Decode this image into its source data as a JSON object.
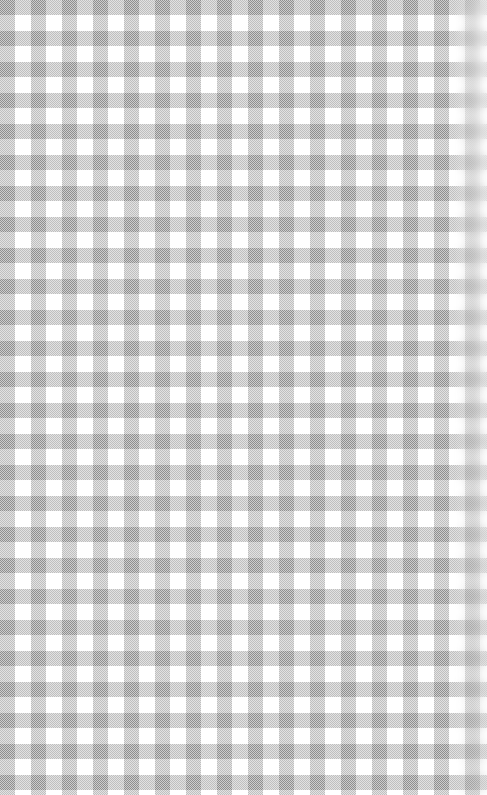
{
  "image": {
    "kind": "seamless-gingham-check-texture",
    "title": "Gray gingham check fabric texture",
    "width_px": 487,
    "height_px": 795
  },
  "pattern": {
    "name": "gingham",
    "alt_names": "buffalo check, vichy check, picnic tablecloth check",
    "cell_size_px": 31,
    "half_cell_px": 15.5,
    "origin_phase": "dark-square-at-top-left",
    "stripe_axes": "two orthogonal stripe sets (horizontal and vertical)",
    "tone_levels": 3,
    "weave_texture": "1px checkerboard dither in the mid-tone bands"
  },
  "colors": {
    "background": "#ffffff",
    "light_square": "#ffffff",
    "mid_tone_band": "#b8b8b8",
    "dark_square": "#808080",
    "stripe_ink": "#808080"
  },
  "effects": {
    "right_edge": {
      "type": "blur-fade",
      "width_px": 34,
      "blur_radius_px": 5,
      "strongest_at": "top",
      "weakest_at": "bottom"
    },
    "left_edge": "sharp",
    "top_edge": "sharp",
    "bottom_edge": "sharp"
  },
  "content": {
    "text": "",
    "note": "No text, icons, controls, or UI chrome are present in this image."
  }
}
